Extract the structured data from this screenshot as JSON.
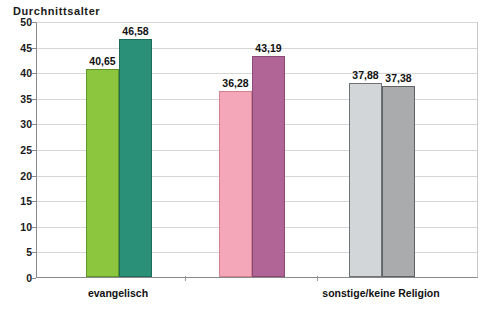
{
  "chart_data": {
    "type": "bar",
    "title": "Durchnittsalter",
    "xlabel": "",
    "ylabel": "",
    "ylim": [
      0,
      50
    ],
    "ytick_step": 5,
    "yticks": [
      "50",
      "45",
      "40",
      "35",
      "30",
      "25",
      "20",
      "15",
      "10",
      "5",
      "0"
    ],
    "grid": true,
    "legend": "none",
    "categories": [
      "evangelisch",
      "",
      "sonstige/keine Religion"
    ],
    "category_labels_visible": [
      "evangelisch",
      "sonstige/keine Religion"
    ],
    "bars": [
      {
        "group": 0,
        "label": "40,65",
        "value": 40.65,
        "color": "#8CC63E",
        "border": "#5f9626"
      },
      {
        "group": 0,
        "label": "46,58",
        "value": 46.58,
        "color": "#2A9078",
        "border": "#1d6b59"
      },
      {
        "group": 1,
        "label": "36,28",
        "value": 36.28,
        "color": "#F4A7B9",
        "border": "#d4818f"
      },
      {
        "group": 1,
        "label": "43,19",
        "value": 43.19,
        "color": "#B06596",
        "border": "#8b4a76"
      },
      {
        "group": 2,
        "label": "37,88",
        "value": 37.88,
        "color": "#D2D6D8",
        "border": "#6f7375"
      },
      {
        "group": 2,
        "label": "37,38",
        "value": 37.38,
        "color": "#A9ABAD",
        "border": "#5f6163"
      }
    ],
    "series": [
      {
        "name": "series-1",
        "values": [
          40.65,
          36.28,
          37.88
        ]
      },
      {
        "name": "series-2",
        "values": [
          46.58,
          43.19,
          37.38
        ]
      }
    ]
  },
  "colors": {
    "axis": "#8a8a8a",
    "grid": "#d6d6d6",
    "text": "#111111",
    "background": "#ffffff"
  }
}
